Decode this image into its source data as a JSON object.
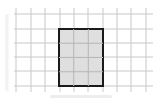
{
  "diagram": {
    "type": "grid-with-shaded-rectangle",
    "grid": {
      "columns_x": [
        16,
        31,
        45,
        60,
        74,
        88,
        103,
        117,
        131,
        146
      ],
      "rows_y": [
        14,
        29,
        43,
        57,
        71,
        86
      ],
      "x_start": 14,
      "x_end": 153,
      "y_start": 8,
      "y_end": 92,
      "line_color": "#c8c8c8"
    },
    "rectangle": {
      "x": 59,
      "y": 29,
      "width": 44,
      "height": 57,
      "cells_wide": 3,
      "cells_tall": 4,
      "fill": "#d9d9d9",
      "stroke": "#1a1a1a",
      "stroke_width": 2
    }
  }
}
